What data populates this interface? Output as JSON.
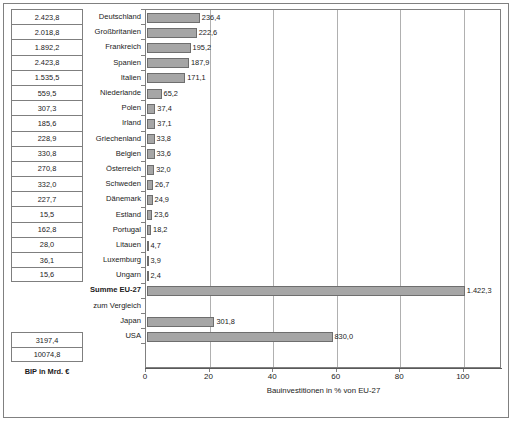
{
  "chart_data": {
    "type": "bar",
    "orientation": "horizontal",
    "title": "",
    "xlabel": "Bauinvestitionen in % von EU-27",
    "ylabel": "",
    "xlim": [
      0,
      112
    ],
    "xticks": [
      0,
      20,
      40,
      60,
      80,
      100
    ],
    "xticklabels": [
      "0",
      "20",
      "40",
      "60",
      "80",
      "100"
    ],
    "grid": true,
    "legend": false,
    "categories": [
      "Deutschland",
      "Großbritanien",
      "Frankreich",
      "Spanien",
      "Italien",
      "Niederlande",
      "Polen",
      "Irland",
      "Griechenland",
      "Belgien",
      "Österreich",
      "Schweden",
      "Dänemark",
      "Estland",
      "Portugal",
      "Litauen",
      "Luxemburg",
      "Ungarn",
      "Summe EU-27",
      "zum Vergleich",
      "Japan",
      "USA"
    ],
    "values": [
      16.62,
      15.65,
      13.72,
      13.21,
      12.03,
      4.58,
      2.63,
      2.61,
      2.38,
      2.36,
      2.25,
      1.88,
      1.75,
      1.66,
      1.28,
      0.33,
      0.27,
      0.17,
      100.0,
      null,
      21.22,
      58.36
    ],
    "datalabels": [
      "236,4",
      "222,6",
      "195,2",
      "187,9",
      "171,1",
      "65,2",
      "37,4",
      "37,1",
      "33,8",
      "33,6",
      "32,0",
      "26,7",
      "24,9",
      "23,6",
      "18,2",
      "4,7",
      "3,9",
      "2,4",
      "1.422,3",
      "",
      "301,8",
      "830,0"
    ],
    "bar_color": "#a6a6a6",
    "bar_edge_color": "#6e6e6e"
  },
  "gdp_table": {
    "caption": "BIP in Mrd. €",
    "values_primary": [
      "2.423,8",
      "2.018,8",
      "1.892,2",
      "2.423,8",
      "1.535,5",
      "559,5",
      "307,3",
      "185,6",
      "228,9",
      "330,8",
      "270,8",
      "332,0",
      "227,7",
      "15,5",
      "162,8",
      "28,0",
      "36,1",
      "15,6"
    ],
    "values_comparison": [
      "3197,4",
      "10074,8"
    ]
  },
  "rows": [
    {
      "gdp": "2.423,8",
      "label": "Deutschland",
      "value": 16.62,
      "datalabel": "236,4",
      "bold": false,
      "bar": true
    },
    {
      "gdp": "2.018,8",
      "label": "Großbritanien",
      "value": 15.65,
      "datalabel": "222,6",
      "bold": false,
      "bar": true
    },
    {
      "gdp": "1.892,2",
      "label": "Frankreich",
      "value": 13.72,
      "datalabel": "195,2",
      "bold": false,
      "bar": true
    },
    {
      "gdp": "2.423,8",
      "label": "Spanien",
      "value": 13.21,
      "datalabel": "187,9",
      "bold": false,
      "bar": true
    },
    {
      "gdp": "1.535,5",
      "label": "Italien",
      "value": 12.03,
      "datalabel": "171,1",
      "bold": false,
      "bar": true
    },
    {
      "gdp": "559,5",
      "label": "Niederlande",
      "value": 4.58,
      "datalabel": "65,2",
      "bold": false,
      "bar": true
    },
    {
      "gdp": "307,3",
      "label": "Polen",
      "value": 2.63,
      "datalabel": "37,4",
      "bold": false,
      "bar": true
    },
    {
      "gdp": "185,6",
      "label": "Irland",
      "value": 2.61,
      "datalabel": "37,1",
      "bold": false,
      "bar": true
    },
    {
      "gdp": "228,9",
      "label": "Griechenland",
      "value": 2.38,
      "datalabel": "33,8",
      "bold": false,
      "bar": true
    },
    {
      "gdp": "330,8",
      "label": "Belgien",
      "value": 2.36,
      "datalabel": "33,6",
      "bold": false,
      "bar": true
    },
    {
      "gdp": "270,8",
      "label": "Österreich",
      "value": 2.25,
      "datalabel": "32,0",
      "bold": false,
      "bar": true
    },
    {
      "gdp": "332,0",
      "label": "Schweden",
      "value": 1.88,
      "datalabel": "26,7",
      "bold": false,
      "bar": true
    },
    {
      "gdp": "227,7",
      "label": "Dänemark",
      "value": 1.75,
      "datalabel": "24,9",
      "bold": false,
      "bar": true
    },
    {
      "gdp": "15,5",
      "label": "Estland",
      "value": 1.66,
      "datalabel": "23,6",
      "bold": false,
      "bar": true
    },
    {
      "gdp": "162,8",
      "label": "Portugal",
      "value": 1.28,
      "datalabel": "18,2",
      "bold": false,
      "bar": true
    },
    {
      "gdp": "28,0",
      "label": "Litauen",
      "value": 0.33,
      "datalabel": "4,7",
      "bold": false,
      "bar": true
    },
    {
      "gdp": "36,1",
      "label": "Luxemburg",
      "value": 0.27,
      "datalabel": "3,9",
      "bold": false,
      "bar": true
    },
    {
      "gdp": "15,6",
      "label": "Ungarn",
      "value": 0.17,
      "datalabel": "2,4",
      "bold": false,
      "bar": true
    },
    {
      "gdp": null,
      "label": "Summe EU-27",
      "value": 100.0,
      "datalabel": "1.422,3",
      "bold": true,
      "bar": true
    },
    {
      "gdp": null,
      "label": "zum Vergleich",
      "value": null,
      "datalabel": "",
      "bold": false,
      "bar": false
    },
    {
      "gdp": "3197,4",
      "label": "Japan",
      "value": 21.22,
      "datalabel": "301,8",
      "bold": false,
      "bar": true
    },
    {
      "gdp": "10074,8",
      "label": "USA",
      "value": 58.36,
      "datalabel": "830,0",
      "bold": false,
      "bar": true
    }
  ],
  "axis": {
    "title": "Bauinvestitionen in % von EU-27",
    "ticks": [
      "0",
      "20",
      "40",
      "60",
      "80",
      "100"
    ]
  },
  "gdp_caption": "BIP in Mrd. €"
}
